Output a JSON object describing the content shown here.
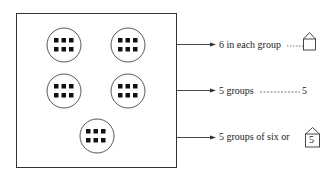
{
  "figure": {
    "groups": [
      {
        "cx": 64,
        "cy": 45,
        "r": 17,
        "items": 6
      },
      {
        "cx": 128,
        "cy": 45,
        "r": 17,
        "items": 6
      },
      {
        "cx": 64,
        "cy": 91,
        "r": 17,
        "items": 6
      },
      {
        "cx": 128,
        "cy": 91,
        "r": 17,
        "items": 6
      },
      {
        "cx": 97,
        "cy": 136,
        "r": 17,
        "items": 6
      }
    ],
    "box": {
      "x": 16,
      "y": 13,
      "w": 160,
      "h": 154
    }
  },
  "labels": {
    "row1": {
      "text": "6 in each group",
      "box_value": ""
    },
    "row2": {
      "text": "5 groups",
      "value": "5"
    },
    "row3": {
      "text": "5 groups of six or",
      "box_value": "5"
    }
  },
  "colors": {
    "ink": "#222222",
    "background": "#ffffff"
  }
}
